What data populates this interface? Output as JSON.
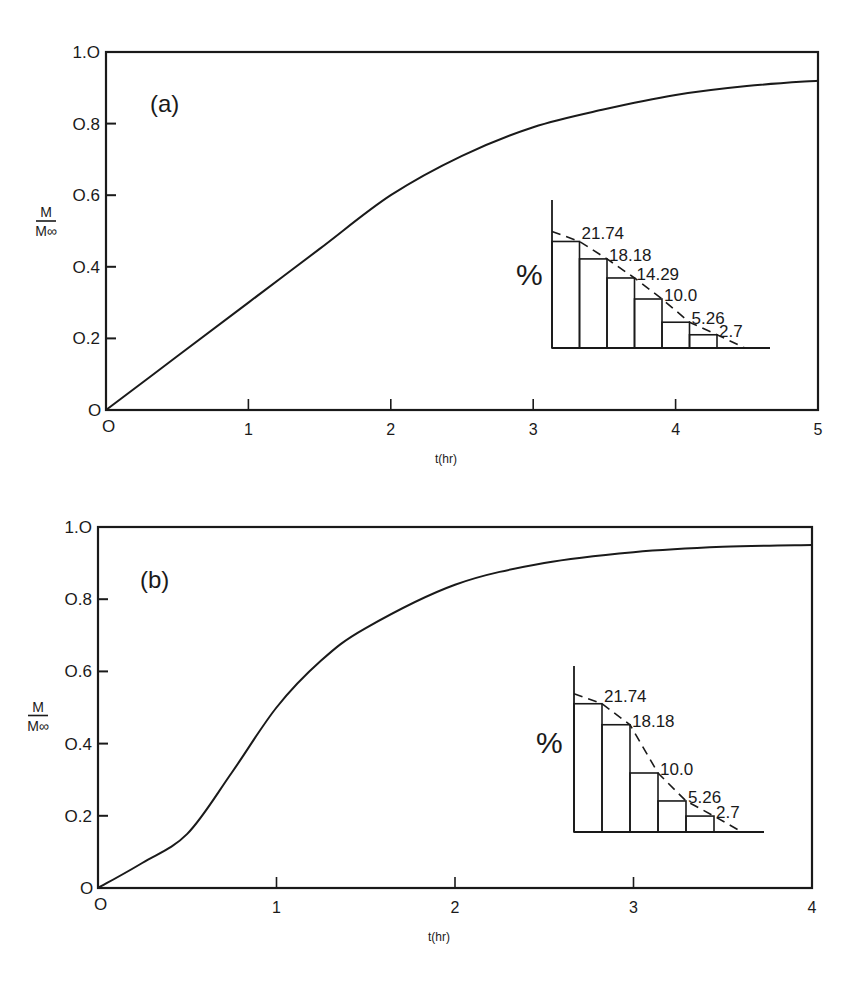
{
  "chart_data": [
    {
      "type": "line",
      "panel": "(a)",
      "title": "",
      "xlabel": "t (hr)",
      "ylabel": "M/M∞",
      "xlim": [
        0,
        5
      ],
      "ylim": [
        0,
        1.0
      ],
      "xticks": [
        "0",
        "1",
        "2",
        "3",
        "4",
        "5"
      ],
      "yticks": [
        "0",
        "0.2",
        "0.4",
        "0.6",
        "0.8",
        "1.0"
      ],
      "grid": false,
      "series": [
        {
          "name": "M/M∞",
          "x": [
            0,
            0.5,
            1,
            1.5,
            2,
            2.5,
            3,
            3.5,
            4,
            4.5,
            5
          ],
          "y": [
            0,
            0.15,
            0.3,
            0.45,
            0.6,
            0.71,
            0.79,
            0.84,
            0.88,
            0.905,
            0.92
          ]
        }
      ],
      "inset": {
        "type": "bar",
        "ylabel": "%",
        "values": [
          21.74,
          18.18,
          14.29,
          10.0,
          5.26,
          2.7
        ],
        "labels": [
          "21.74",
          "18.18",
          "14.29",
          "10.0",
          "5.26",
          "2.7"
        ],
        "trend_line": "dashed"
      }
    },
    {
      "type": "line",
      "panel": "(b)",
      "title": "",
      "xlabel": "t (hr)",
      "ylabel": "M/M∞",
      "xlim": [
        0,
        4
      ],
      "ylim": [
        0,
        1.0
      ],
      "xticks": [
        "0",
        "1",
        "2",
        "3",
        "4"
      ],
      "yticks": [
        "0",
        "0.2",
        "0.4",
        "0.6",
        "0.8",
        "1.0"
      ],
      "grid": false,
      "series": [
        {
          "name": "M/M∞",
          "x": [
            0,
            0.25,
            0.5,
            0.75,
            1,
            1.25,
            1.5,
            2,
            2.5,
            3,
            3.5,
            4
          ],
          "y": [
            0,
            0.07,
            0.15,
            0.32,
            0.5,
            0.63,
            0.72,
            0.84,
            0.9,
            0.93,
            0.945,
            0.95
          ]
        }
      ],
      "inset": {
        "type": "bar",
        "ylabel": "%",
        "values": [
          21.74,
          18.18,
          10.0,
          5.26,
          2.7
        ],
        "labels": [
          "21.74",
          "18.18",
          "10.0",
          "5.26",
          "2.7"
        ],
        "trend_line": "dashed"
      }
    }
  ],
  "labels": {
    "panel_a": "(a)",
    "panel_b": "(b)",
    "y_num": "M",
    "y_den": "M∞",
    "x_title": "t(hr)",
    "pct": "%",
    "origin_y": "O",
    "origin_x": "O"
  },
  "colors": {
    "ink": "#1a1a1a",
    "background": "#ffffff"
  }
}
